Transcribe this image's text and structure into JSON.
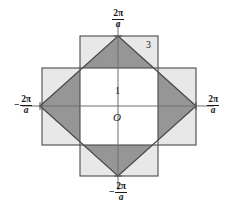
{
  "figure": {
    "origin_label": "O",
    "zone_labels": [
      {
        "text": "1",
        "name": "zone-1-label"
      },
      {
        "text": "2",
        "name": "zone-2-label"
      },
      {
        "text": "3",
        "name": "zone-3-label"
      }
    ],
    "axis_labels": {
      "top": {
        "sign": "",
        "numerator": "2π",
        "denominator": "a"
      },
      "bottom": {
        "sign": "−",
        "numerator": "2π",
        "denominator": "a"
      },
      "left": {
        "sign": "−",
        "numerator": "2π",
        "denominator": "a"
      },
      "right": {
        "sign": "",
        "numerator": "2π",
        "denominator": "a"
      }
    },
    "colors": {
      "background": "#ffffff",
      "zone1_fill": "#ffffff",
      "zone2_fill": "#969696",
      "zone3_fill": "#e8e8e8",
      "stroke": "#4a4a4a",
      "axis": "#6e6e6e",
      "text": "#1a1a1a"
    },
    "geometry": {
      "center_x": 118,
      "center_y": 106,
      "half_extent": 40,
      "vertical_square": {
        "x": 80,
        "y": 36,
        "w": 78,
        "h": 140
      },
      "horizontal_square": {
        "x": 42,
        "y": 68,
        "w": 154,
        "h": 77
      },
      "diamond_vertices": "118,36 196,106 118,176 40,106"
    }
  }
}
